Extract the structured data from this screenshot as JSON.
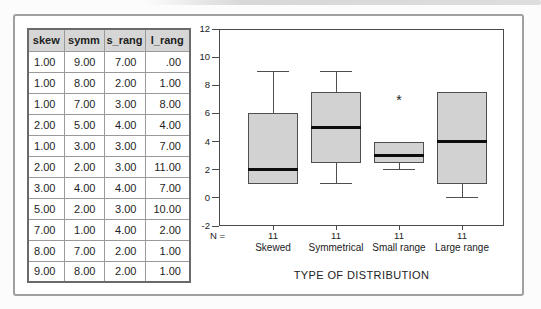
{
  "colors": {
    "frame_border": "#a0a0a0",
    "table_header_bg": "#d6d6d6",
    "axis_color": "#4a4a4a",
    "box_fill": "#d2d2d2",
    "box_border": "#4f4f4f",
    "median_color": "#0d0d0d"
  },
  "table": {
    "headers": [
      "skew",
      "symm",
      "s_rang",
      "l_rang"
    ],
    "rows": [
      [
        "1.00",
        "9.00",
        "7.00",
        ".00"
      ],
      [
        "1.00",
        "8.00",
        "2.00",
        "1.00"
      ],
      [
        "1.00",
        "7.00",
        "3.00",
        "8.00"
      ],
      [
        "2.00",
        "5.00",
        "4.00",
        "4.00"
      ],
      [
        "1.00",
        "3.00",
        "3.00",
        "7.00"
      ],
      [
        "2.00",
        "2.00",
        "3.00",
        "11.00"
      ],
      [
        "3.00",
        "4.00",
        "4.00",
        "7.00"
      ],
      [
        "5.00",
        "2.00",
        "3.00",
        "10.00"
      ],
      [
        "7.00",
        "1.00",
        "4.00",
        "2.00"
      ],
      [
        "8.00",
        "7.00",
        "2.00",
        "1.00"
      ],
      [
        "9.00",
        "8.00",
        "2.00",
        "1.00"
      ]
    ]
  },
  "chart_data": {
    "type": "boxplot",
    "title": "",
    "xlabel": "TYPE OF DISTRIBUTION",
    "ylabel": "",
    "ylim": [
      -2,
      12
    ],
    "yticks": [
      "12",
      "10",
      "8",
      "6",
      "4",
      "2",
      "0",
      "-2"
    ],
    "grid": false,
    "n_label_prefix": "N =",
    "counts": [
      "11",
      "11",
      "11",
      "11"
    ],
    "categories": [
      "Skewed",
      "Symmetrical",
      "Small range",
      "Large range"
    ],
    "outlier_marker": "*",
    "series": [
      {
        "name": "Skewed",
        "whisker_low": 1,
        "q1": 1,
        "median": 2,
        "q3": 6,
        "whisker_high": 9,
        "outliers": []
      },
      {
        "name": "Symmetrical",
        "whisker_low": 1,
        "q1": 2.5,
        "median": 5,
        "q3": 7.5,
        "whisker_high": 9,
        "outliers": []
      },
      {
        "name": "Small range",
        "whisker_low": 2,
        "q1": 2.5,
        "median": 3,
        "q3": 4,
        "whisker_high": 4,
        "outliers": [
          7
        ]
      },
      {
        "name": "Large range",
        "whisker_low": 0,
        "q1": 1,
        "median": 4,
        "q3": 7.5,
        "whisker_high": 7.5,
        "outliers": []
      }
    ]
  }
}
